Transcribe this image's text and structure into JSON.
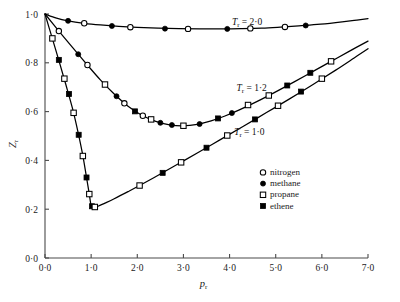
{
  "chart_data": {
    "type": "line",
    "title": "",
    "xlabel": "p_r",
    "ylabel": "Z_r",
    "xlim": [
      0.0,
      7.0
    ],
    "ylim": [
      0.0,
      1.0
    ],
    "grid": false,
    "legend_position": "inside-right",
    "x_ticks": [
      "0·0",
      "1·0",
      "2·0",
      "3·0",
      "4·0",
      "5·0",
      "6·0",
      "7·0"
    ],
    "x_tick_values": [
      0,
      1,
      2,
      3,
      4,
      5,
      6,
      7
    ],
    "y_ticks": [
      "0·0",
      "0·2",
      "0·4",
      "0·6",
      "0·8",
      "1·0"
    ],
    "y_tick_values": [
      0,
      0.2,
      0.4,
      0.6,
      0.8,
      1.0
    ],
    "annotations": [
      {
        "name": "tr-2-0",
        "text": "Tᵣ = 2·0",
        "x": 4.05,
        "y": 0.955
      },
      {
        "name": "tr-1-2",
        "text": "Tᵣ = 1·2",
        "x": 4.15,
        "y": 0.685
      },
      {
        "name": "tr-1-0",
        "text": "Tᵣ = 1·0",
        "x": 4.1,
        "y": 0.505
      }
    ],
    "series": [
      {
        "name": "Tr = 2.0",
        "label": "T_r = 2·0",
        "x": [
          0.0,
          0.25,
          0.5,
          0.85,
          1.2,
          1.6,
          2.0,
          2.45,
          2.9,
          3.35,
          3.8,
          4.25,
          4.7,
          5.1,
          5.5,
          5.9,
          6.3,
          6.7,
          7.0
        ],
        "y": [
          1.0,
          0.983,
          0.972,
          0.962,
          0.955,
          0.949,
          0.945,
          0.942,
          0.94,
          0.939,
          0.939,
          0.94,
          0.942,
          0.946,
          0.951,
          0.957,
          0.965,
          0.974,
          0.981
        ],
        "markers": [
          {
            "x": 0.5,
            "y": 0.972,
            "type": "filled-circle"
          },
          {
            "x": 0.85,
            "y": 0.962,
            "type": "open-circle"
          },
          {
            "x": 1.45,
            "y": 0.951,
            "type": "filled-circle"
          },
          {
            "x": 1.85,
            "y": 0.946,
            "type": "open-circle"
          },
          {
            "x": 2.6,
            "y": 0.94,
            "type": "filled-circle"
          },
          {
            "x": 3.1,
            "y": 0.939,
            "type": "open-circle"
          },
          {
            "x": 3.95,
            "y": 0.939,
            "type": "filled-circle"
          },
          {
            "x": 4.45,
            "y": 0.941,
            "type": "open-circle"
          },
          {
            "x": 5.2,
            "y": 0.947,
            "type": "open-circle"
          },
          {
            "x": 5.65,
            "y": 0.953,
            "type": "filled-circle"
          }
        ]
      },
      {
        "name": "Tr = 1.2",
        "label": "T_r = 1·2",
        "x": [
          0.0,
          0.3,
          0.6,
          0.9,
          1.2,
          1.5,
          1.8,
          2.1,
          2.4,
          2.7,
          3.0,
          3.3,
          3.6,
          3.9,
          4.2,
          4.6,
          5.0,
          5.4,
          5.8,
          6.2,
          6.6,
          7.0
        ],
        "y": [
          1.0,
          0.93,
          0.862,
          0.795,
          0.73,
          0.672,
          0.622,
          0.585,
          0.56,
          0.546,
          0.542,
          0.548,
          0.562,
          0.582,
          0.606,
          0.642,
          0.681,
          0.722,
          0.764,
          0.806,
          0.848,
          0.889
        ],
        "markers": [
          {
            "x": 0.3,
            "y": 0.93,
            "type": "open-circle"
          },
          {
            "x": 0.72,
            "y": 0.835,
            "type": "filled-circle"
          },
          {
            "x": 0.92,
            "y": 0.791,
            "type": "open-circle"
          },
          {
            "x": 1.3,
            "y": 0.711,
            "type": "open-square"
          },
          {
            "x": 1.55,
            "y": 0.663,
            "type": "filled-circle"
          },
          {
            "x": 1.72,
            "y": 0.634,
            "type": "open-circle"
          },
          {
            "x": 1.95,
            "y": 0.601,
            "type": "filled-square"
          },
          {
            "x": 2.12,
            "y": 0.583,
            "type": "open-circle"
          },
          {
            "x": 2.3,
            "y": 0.568,
            "type": "open-square"
          },
          {
            "x": 2.5,
            "y": 0.554,
            "type": "filled-circle"
          },
          {
            "x": 2.75,
            "y": 0.545,
            "type": "filled-circle"
          },
          {
            "x": 3.0,
            "y": 0.542,
            "type": "open-square"
          },
          {
            "x": 3.35,
            "y": 0.549,
            "type": "filled-circle"
          },
          {
            "x": 3.75,
            "y": 0.572,
            "type": "filled-square"
          },
          {
            "x": 4.05,
            "y": 0.594,
            "type": "filled-circle"
          },
          {
            "x": 4.4,
            "y": 0.627,
            "type": "open-square"
          },
          {
            "x": 4.85,
            "y": 0.666,
            "type": "open-square"
          },
          {
            "x": 5.25,
            "y": 0.707,
            "type": "filled-square"
          },
          {
            "x": 5.75,
            "y": 0.759,
            "type": "filled-square"
          },
          {
            "x": 6.2,
            "y": 0.806,
            "type": "open-square"
          }
        ]
      },
      {
        "name": "Tr = 1.0",
        "label": "T_r = 1·0",
        "x": [
          0.0,
          0.15,
          0.3,
          0.45,
          0.6,
          0.72,
          0.82,
          0.9,
          0.96,
          1.0,
          1.06,
          1.15,
          1.3,
          1.5,
          1.8,
          2.1,
          2.5,
          2.9,
          3.3,
          3.8,
          4.3,
          4.8,
          5.3,
          5.8,
          6.3,
          6.7,
          7.0
        ],
        "y": [
          1.0,
          0.905,
          0.81,
          0.712,
          0.61,
          0.512,
          0.42,
          0.33,
          0.262,
          0.215,
          0.208,
          0.212,
          0.225,
          0.243,
          0.272,
          0.302,
          0.344,
          0.387,
          0.43,
          0.485,
          0.54,
          0.596,
          0.652,
          0.71,
          0.77,
          0.82,
          0.858
        ],
        "markers": [
          {
            "x": 0.16,
            "y": 0.9,
            "type": "open-square"
          },
          {
            "x": 0.3,
            "y": 0.812,
            "type": "filled-square"
          },
          {
            "x": 0.42,
            "y": 0.735,
            "type": "open-square"
          },
          {
            "x": 0.52,
            "y": 0.672,
            "type": "filled-square"
          },
          {
            "x": 0.62,
            "y": 0.595,
            "type": "open-square"
          },
          {
            "x": 0.73,
            "y": 0.505,
            "type": "filled-square"
          },
          {
            "x": 0.82,
            "y": 0.418,
            "type": "open-square"
          },
          {
            "x": 0.9,
            "y": 0.33,
            "type": "filled-square"
          },
          {
            "x": 0.96,
            "y": 0.262,
            "type": "open-square"
          },
          {
            "x": 1.02,
            "y": 0.212,
            "type": "filled-square"
          },
          {
            "x": 1.08,
            "y": 0.209,
            "type": "open-square"
          },
          {
            "x": 2.05,
            "y": 0.297,
            "type": "open-square"
          },
          {
            "x": 2.55,
            "y": 0.349,
            "type": "filled-square"
          },
          {
            "x": 2.95,
            "y": 0.392,
            "type": "open-square"
          },
          {
            "x": 3.5,
            "y": 0.452,
            "type": "filled-square"
          },
          {
            "x": 3.95,
            "y": 0.502,
            "type": "open-square"
          },
          {
            "x": 4.55,
            "y": 0.568,
            "type": "filled-square"
          },
          {
            "x": 5.05,
            "y": 0.624,
            "type": "open-square"
          },
          {
            "x": 5.55,
            "y": 0.682,
            "type": "filled-square"
          },
          {
            "x": 6.0,
            "y": 0.735,
            "type": "open-square"
          }
        ]
      }
    ],
    "legend": [
      {
        "label": "nitrogen",
        "marker": "open-circle"
      },
      {
        "label": "methane",
        "marker": "filled-circle"
      },
      {
        "label": "propane",
        "marker": "open-square"
      },
      {
        "label": "ethene",
        "marker": "filled-square"
      }
    ]
  }
}
